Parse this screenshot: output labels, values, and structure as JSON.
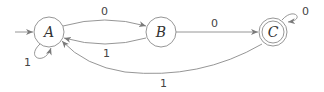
{
  "diagram": {
    "type": "finite-automaton",
    "colors": {
      "stroke": "#8a8a8a",
      "text": "#333333",
      "background": "#ffffff"
    },
    "states": [
      {
        "id": "A",
        "label": "A",
        "initial": true,
        "accepting": false
      },
      {
        "id": "B",
        "label": "B",
        "initial": false,
        "accepting": false
      },
      {
        "id": "C",
        "label": "C",
        "initial": false,
        "accepting": true
      }
    ],
    "transitions": [
      {
        "from": "A",
        "to": "B",
        "label": "0"
      },
      {
        "from": "B",
        "to": "A",
        "label": "1"
      },
      {
        "from": "B",
        "to": "C",
        "label": "0"
      },
      {
        "from": "C",
        "to": "A",
        "label": "1"
      },
      {
        "from": "A",
        "to": "A",
        "label": "1"
      },
      {
        "from": "C",
        "to": "C",
        "label": "0"
      }
    ]
  }
}
